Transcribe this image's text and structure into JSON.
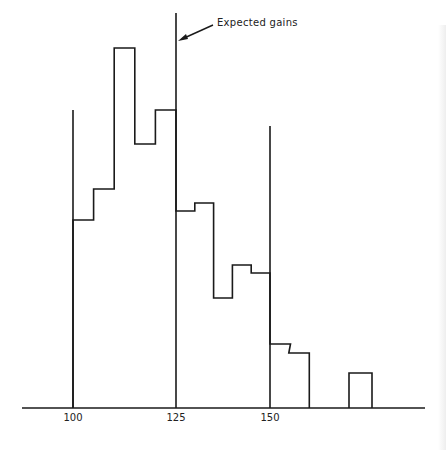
{
  "chart_data": {
    "type": "bar",
    "title": "",
    "xlabel": "",
    "ylabel": "",
    "grid": false,
    "legend": null,
    "bin_width": 5,
    "x_ticks": [
      100,
      125,
      150
    ],
    "x_tick_labels": [
      "100",
      "125",
      "150"
    ],
    "xlim": [
      88,
      190
    ],
    "categories": [
      "100-105",
      "105-110",
      "110-115",
      "115-120",
      "120-125",
      "125-130",
      "130-135",
      "135-140",
      "140-145",
      "145-150",
      "150-155",
      "155-160",
      "160-165",
      "165-170",
      "170-175"
    ],
    "values": [
      188,
      219,
      360,
      264,
      298,
      197,
      205,
      110,
      143,
      135,
      64,
      55,
      0,
      0,
      35
    ],
    "value_note": "relative bar heights (no y-axis shown)",
    "reference_lines": [
      {
        "x": 100,
        "top_height": 298
      },
      {
        "x": 125,
        "top_height": 395
      },
      {
        "x": 150,
        "top_height": 282
      }
    ],
    "annotations": [
      {
        "text": "Expected gains",
        "points_to_x": 125
      }
    ]
  },
  "labels": {
    "annotation": "Expected gains",
    "ticks": [
      "100",
      "125",
      "150"
    ]
  }
}
